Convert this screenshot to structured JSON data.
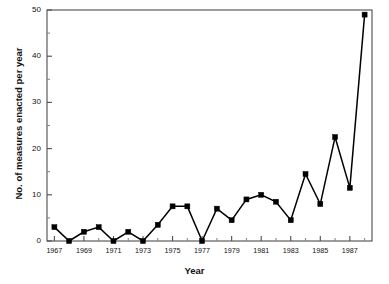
{
  "chart_data": {
    "type": "line",
    "title": "",
    "xlabel": "Year",
    "ylabel": "No. of measures enacted per year",
    "xlim": [
      1966.5,
      1988.5
    ],
    "ylim": [
      0,
      50
    ],
    "grid": false,
    "legend": "none",
    "marker": "filled-square",
    "line_color": "#000000",
    "marker_color": "#000000",
    "ytick_labels": [
      "0",
      "10",
      "20",
      "30",
      "40",
      "50"
    ],
    "ytick_values": [
      0,
      10,
      20,
      30,
      40,
      50
    ],
    "yminor_step": 5,
    "xtick_labels": [
      "1967",
      "1969",
      "1971",
      "1973",
      "1975",
      "1977",
      "1979",
      "1981",
      "1983",
      "1985",
      "1987"
    ],
    "xtick_values": [
      1967,
      1969,
      1971,
      1973,
      1975,
      1977,
      1979,
      1981,
      1983,
      1985,
      1987
    ],
    "x": [
      1967,
      1968,
      1969,
      1970,
      1971,
      1972,
      1973,
      1974,
      1975,
      1976,
      1977,
      1978,
      1979,
      1980,
      1981,
      1982,
      1983,
      1984,
      1985,
      1986,
      1987,
      1988
    ],
    "values": [
      3,
      0,
      2,
      3,
      0,
      2,
      0,
      3.5,
      7.5,
      7.5,
      0,
      7,
      4.5,
      9,
      10,
      8.5,
      4.5,
      14.5,
      8,
      22.5,
      11.5,
      49
    ]
  }
}
